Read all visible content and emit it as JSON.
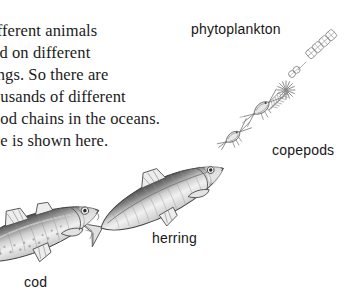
{
  "page": {
    "background_color": "#ffffff",
    "width": 359,
    "height": 307
  },
  "body_text": {
    "content": "ifferent animals\ned on different\nings. So there are\nousands of different\nood chains in the oceans.\nne is shown here.",
    "lines": [
      "ifferent animals",
      "ed on different",
      "ings. So there are",
      "ousands of different",
      "ood chains in the oceans.",
      "ne is shown here."
    ],
    "note_clipped_left_margin": true,
    "color": "#1b1b1b"
  },
  "labels": {
    "phytoplankton": "phytoplankton",
    "copepods": "copepods",
    "herring": "herring",
    "cod": "cod"
  },
  "illustrations": {
    "phytoplankton": {
      "name": "phytoplankton-illustration",
      "description": "diagonal chain of diatom cells with star-shaped radiolarian and feathery diatom"
    },
    "copepods": {
      "name": "copepods-illustration",
      "description": "two small copepod crustaceans with long antennae"
    },
    "herring": {
      "name": "herring-illustration",
      "description": "grayscale herring fish angled up to the right"
    },
    "cod": {
      "name": "cod-illustration",
      "description": "grayscale cod fish angled up to the right, clipped at left page edge"
    }
  },
  "food_chain": {
    "order": [
      "phytoplankton",
      "copepods",
      "herring",
      "cod"
    ],
    "direction": "top-right to bottom-left"
  }
}
